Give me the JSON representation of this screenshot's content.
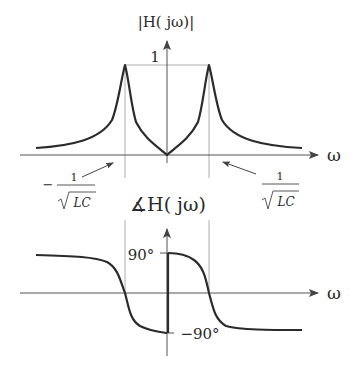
{
  "top_plot": {
    "title": "|H( jω)|",
    "y_tick_label": "1",
    "x_axis_label": "ω",
    "left_marker": {
      "sign": "−",
      "numerator": "1",
      "denominator": "LC"
    },
    "right_marker": {
      "numerator": "1",
      "denominator": "LC"
    }
  },
  "bottom_plot": {
    "title": "∡H( jω)",
    "pos_tick_label": "90°",
    "neg_tick_label": "−90°",
    "x_axis_label": "ω"
  },
  "colors": {
    "curve": "#2b2b2b",
    "axis": "#555555",
    "guide": "#9a9a9a"
  }
}
